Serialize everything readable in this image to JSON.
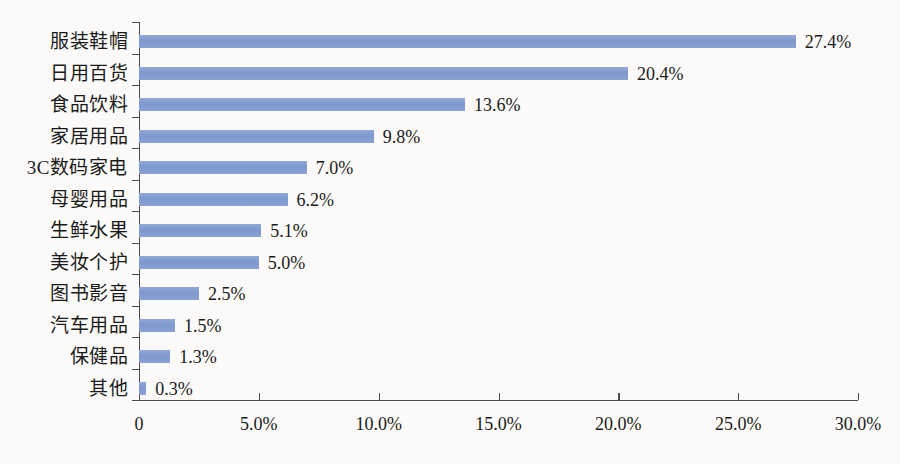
{
  "chart_data": {
    "type": "bar",
    "orientation": "horizontal",
    "title": "",
    "subtitle": "",
    "xlabel": "",
    "ylabel": "",
    "categories": [
      "服装鞋帽",
      "日用百货",
      "食品饮料",
      "家居用品",
      "3C数码家电",
      "母婴用品",
      "生鲜水果",
      "美妆个护",
      "图书影音",
      "汽车用品",
      "保健品",
      "其他"
    ],
    "values": [
      27.4,
      20.4,
      13.6,
      9.8,
      7.0,
      6.2,
      5.1,
      5.0,
      2.5,
      1.5,
      1.3,
      0.3
    ],
    "data_labels": [
      "27.4%",
      "20.4%",
      "13.6%",
      "9.8%",
      "7.0%",
      "6.2%",
      "5.1%",
      "5.0%",
      "2.5%",
      "1.5%",
      "1.3%",
      "0.3%"
    ],
    "xlim": [
      0,
      30
    ],
    "xticks": [
      0,
      5,
      10,
      15,
      20,
      25,
      30
    ],
    "xtick_labels": [
      "0",
      "5.0%",
      "10.0%",
      "15.0%",
      "20.0%",
      "25.0%",
      "30.0%"
    ],
    "grid": false,
    "legend": false,
    "legend_position": "none",
    "series": [
      {
        "name": "",
        "values": [
          27.4,
          20.4,
          13.6,
          9.8,
          7.0,
          6.2,
          5.1,
          5.0,
          2.5,
          1.5,
          1.3,
          0.3
        ]
      }
    ],
    "colors": {
      "bar": "#8099cf",
      "axis": "#4a4a4a",
      "text": "#1a1a1a",
      "background": "#fbfaf8"
    }
  }
}
